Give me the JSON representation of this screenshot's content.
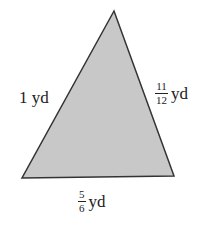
{
  "diagram": {
    "type": "triangle",
    "fill_color": "#c8c8c8",
    "stroke_color": "#333333",
    "vertices": {
      "apex": [
        114,
        11
      ],
      "bottom_left": [
        22,
        178
      ],
      "bottom_right": [
        174,
        176
      ]
    },
    "sides": {
      "left": {
        "value": "1",
        "unit": "yd",
        "text": "1 yd"
      },
      "right": {
        "numerator": "11",
        "denominator": "12",
        "unit": "yd"
      },
      "bottom": {
        "numerator": "5",
        "denominator": "6",
        "unit": "yd"
      }
    }
  }
}
